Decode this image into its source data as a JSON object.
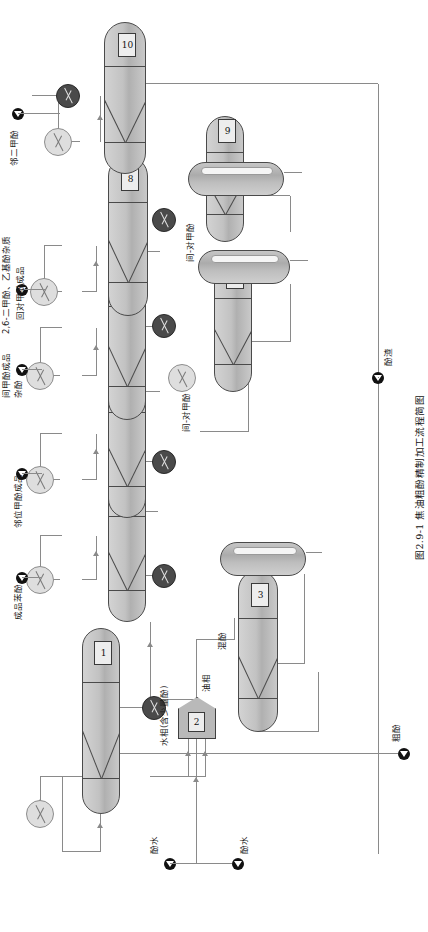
{
  "figure": {
    "caption": "图2.9-1  焦油粗酚精制加工流程简图",
    "caption_number": "图2.9-1",
    "caption_title": "焦油粗酚精制加工流程简图"
  },
  "units": [
    {
      "id": "1",
      "tag": "1",
      "type": "column",
      "name": "脱水塔"
    },
    {
      "id": "2",
      "tag": "2",
      "type": "decanter",
      "name": "油水分离器"
    },
    {
      "id": "3",
      "tag": "3",
      "type": "column",
      "name": "粗酚蒸馏塔"
    },
    {
      "id": "4",
      "tag": "4",
      "type": "column",
      "name": "苯酚塔"
    },
    {
      "id": "5",
      "tag": "5",
      "type": "column",
      "name": "邻甲酚塔"
    },
    {
      "id": "6",
      "tag": "6",
      "type": "column",
      "name": "间对甲酚塔"
    },
    {
      "id": "7",
      "tag": "7",
      "type": "column",
      "name": "杂酚塔"
    },
    {
      "id": "8",
      "tag": "8",
      "type": "column",
      "name": "二甲酚塔"
    },
    {
      "id": "9",
      "tag": "9",
      "type": "column",
      "name": "二甲酚精馏塔"
    },
    {
      "id": "10",
      "tag": "10",
      "type": "column",
      "name": "邻二甲酚塔"
    }
  ],
  "streams": [
    {
      "key": "crude_phenol",
      "label": "粗酚",
      "kind": "feed"
    },
    {
      "key": "phenol_water_in",
      "label": "酚水",
      "kind": "feed"
    },
    {
      "key": "phenol_water_out",
      "label": "酚水",
      "kind": "product"
    },
    {
      "key": "aqueous_phase",
      "label": "水相(含少量酚)",
      "kind": "internal"
    },
    {
      "key": "oil_phase",
      "label": "油相",
      "kind": "internal"
    },
    {
      "key": "crude_phenol_cut",
      "label": "混酚",
      "kind": "internal"
    },
    {
      "key": "phenol_product",
      "label": "成品苯酚",
      "kind": "product"
    },
    {
      "key": "ortho_cresol",
      "label": "邻位甲酚成品",
      "kind": "product"
    },
    {
      "key": "meta_para_cresol",
      "label": "间-对甲酚",
      "kind": "internal"
    },
    {
      "key": "xylenol_product",
      "label": "杂酚",
      "kind": "product"
    },
    {
      "key": "meta_cresol",
      "label": "间甲酚成品",
      "kind": "product"
    },
    {
      "key": "mp_cresol_back",
      "label": "间-对甲酚",
      "kind": "internal"
    },
    {
      "key": "dimethyl_mix",
      "label": "2,6-二甲酚、乙基酚杂质",
      "kind": "product"
    },
    {
      "key": "para_cresol_back",
      "label": "回对甲酚成品",
      "kind": "internal"
    },
    {
      "key": "ortho_xylenol",
      "label": "邻二甲酚",
      "kind": "product"
    },
    {
      "key": "phenol_residue",
      "label": "酚渣",
      "kind": "product"
    }
  ],
  "equipment_icons": [
    {
      "key": "condenser",
      "icon": "condenser-icon",
      "count": 7,
      "color": "#dedede"
    },
    {
      "key": "reboiler",
      "icon": "reboiler-icon",
      "count": 5,
      "color": "#4a4a4a"
    },
    {
      "key": "marker",
      "icon": "stream-arrow-icon",
      "count": 9,
      "color": "#111111"
    }
  ],
  "colors": {
    "line": "#8a8a8a",
    "outline": "#4a4a4a",
    "vessel_fill": "#c2c2c2",
    "condenser_fill": "#dedede",
    "reboiler_fill": "#4a4a4a",
    "tag_fill": "#ededed",
    "background": "#ffffff"
  }
}
